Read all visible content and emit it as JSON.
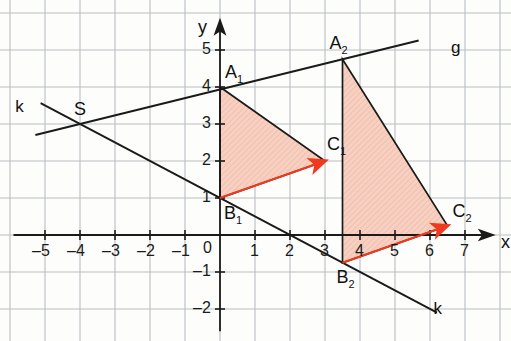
{
  "figure": {
    "kind": "coordinate-geometry-diagram",
    "background_color": "#fdfdfb",
    "grid_color": "#b9bdc4",
    "grid_minor_color": "#d7dade",
    "axis_color": "#1a1a1a",
    "line_color": "#1a1a1a",
    "triangle_fill": "#f6cdbe",
    "triangle_hatch": "#efb9a6",
    "triangle_stroke": "#1a1a1a",
    "arrow_color": "#ee3b20"
  },
  "axes": {
    "x_label": "x",
    "y_label": "y",
    "origin_label": "0",
    "x_ticks": [
      "-5",
      "-4",
      "-3",
      "-2",
      "-1",
      "1",
      "2",
      "3",
      "4",
      "5",
      "6",
      "7"
    ],
    "x_tick_values": [
      -5,
      -4,
      -3,
      -2,
      -1,
      1,
      2,
      3,
      4,
      5,
      6,
      7
    ],
    "y_ticks": [
      "5",
      "4",
      "3",
      "2",
      "1",
      "-1",
      "-2"
    ],
    "y_tick_values": [
      5,
      4,
      3,
      2,
      1,
      -1,
      -2
    ],
    "x_range": [
      -5.9,
      7.8
    ],
    "y_range": [
      -2.6,
      5.8
    ],
    "unit_px_x": 35,
    "unit_px_y": 37,
    "origin_px": [
      220,
      235
    ]
  },
  "points": {
    "S": {
      "label": "S",
      "x": -4,
      "y": 3
    },
    "A1": {
      "label": "A",
      "sub": "1",
      "x": 0,
      "y": 4
    },
    "B1": {
      "label": "B",
      "sub": "1",
      "x": 0,
      "y": 1
    },
    "C1": {
      "label": "C",
      "sub": "1",
      "x": 3,
      "y": 2
    },
    "A2": {
      "label": "A",
      "sub": "2",
      "x": 3.5,
      "y": 4.75
    },
    "B2": {
      "label": "B",
      "sub": "2",
      "x": 3.5,
      "y": -0.75
    },
    "C2": {
      "label": "C",
      "sub": "2",
      "x": 6.5,
      "y": 0.25
    }
  },
  "lines": {
    "g": {
      "label": "g",
      "through": [
        "S",
        "A1",
        "A2"
      ],
      "label_x": 6.6,
      "label_y": 5.05
    },
    "k": {
      "label": "k",
      "through": [
        "S",
        "B1",
        "B2"
      ],
      "label_x": 6.1,
      "label_y": -2.0
    },
    "k_left_label": {
      "label": "k",
      "label_x": -5.85,
      "label_y": 3.45
    }
  },
  "triangles": [
    {
      "name": "triangle-1",
      "vertices": [
        "A1",
        "B1",
        "C1"
      ]
    },
    {
      "name": "triangle-2",
      "vertices": [
        "A2",
        "B2",
        "C2"
      ]
    }
  ],
  "arrows": [
    {
      "name": "arrow-B1-C1",
      "from": "B1",
      "to": "C1"
    },
    {
      "name": "arrow-B2-C2",
      "from": "B2",
      "to": "C2"
    }
  ]
}
